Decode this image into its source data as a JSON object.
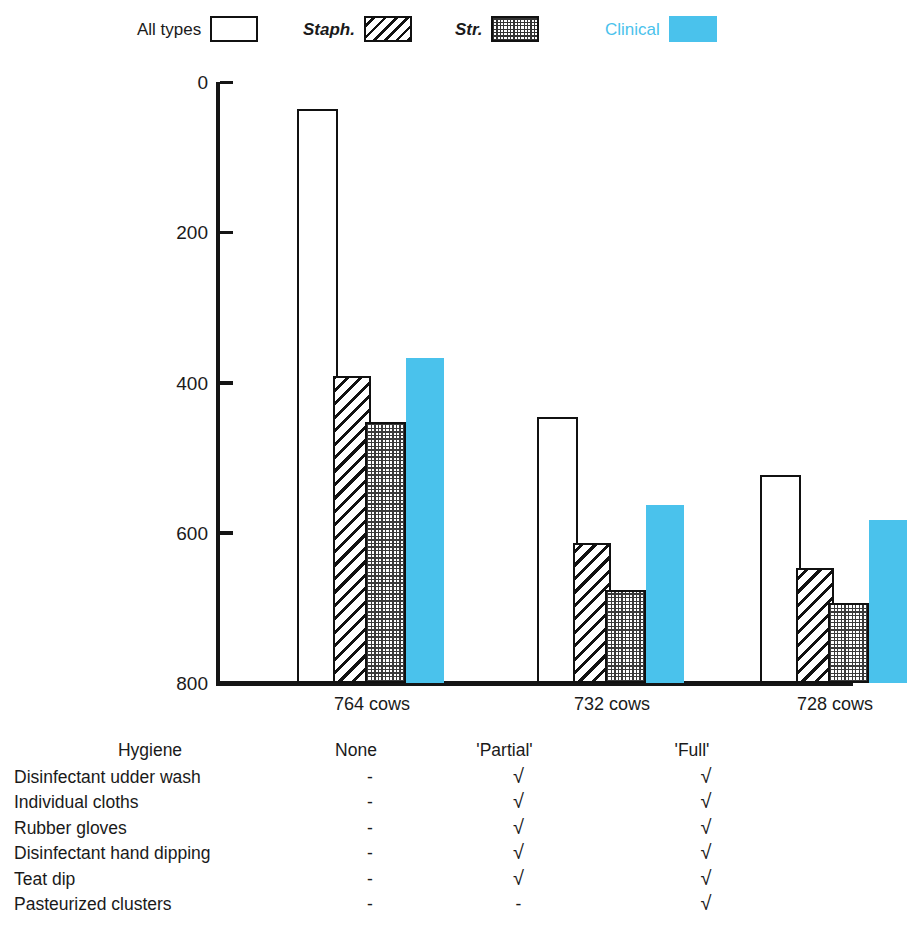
{
  "legend": {
    "items": [
      {
        "label": "All types",
        "style": "outline",
        "icon": "legend-swatch-outline",
        "x": 137
      },
      {
        "label": "Staph.",
        "style": "diagonal",
        "icon": "legend-swatch-hatched",
        "x": 303
      },
      {
        "label": "Str.",
        "style": "dotted",
        "icon": "legend-swatch-stippled",
        "x": 455
      },
      {
        "label": "Clinical",
        "style": "solid",
        "icon": "legend-swatch-solid",
        "x": 605
      }
    ]
  },
  "axis": {
    "y_ticks": [
      "800",
      "600",
      "400",
      "200",
      "0"
    ],
    "y_tick_values": [
      800,
      600,
      400,
      200,
      0
    ]
  },
  "x_labels": [
    "764 cows",
    "732 cows",
    "728 cows"
  ],
  "colors": {
    "clinical": "#4ac2ec",
    "clinical_text": "#4ac2ec",
    "axis": "#151515",
    "text": "#1a1a1a"
  },
  "table": {
    "header": {
      "name": "Hygiene",
      "values": [
        "None",
        "'Partial'",
        "'Full'"
      ]
    },
    "rows": [
      {
        "name": "Disinfectant udder wash",
        "values": [
          "-",
          "√",
          "√"
        ]
      },
      {
        "name": "Individual cloths",
        "values": [
          "-",
          "√",
          "√"
        ]
      },
      {
        "name": "Rubber gloves",
        "values": [
          "-",
          "√",
          "√"
        ]
      },
      {
        "name": "Disinfectant hand dipping",
        "values": [
          "-",
          "√",
          "√"
        ]
      },
      {
        "name": "Teat dip",
        "values": [
          "-",
          "√",
          "√"
        ]
      },
      {
        "name": "Pasteurized clusters",
        "values": [
          "-",
          "-",
          "√"
        ]
      }
    ]
  },
  "chart_data": {
    "type": "bar",
    "title": "",
    "xlabel": "",
    "ylabel": "",
    "ylim": [
      0,
      800
    ],
    "yticks": [
      0,
      200,
      400,
      600,
      800
    ],
    "grid": false,
    "legend_position": "top",
    "categories": [
      "764 cows",
      "732 cows",
      "728 cows"
    ],
    "series": [
      {
        "name": "All types",
        "values": [
          764,
          354,
          277
        ]
      },
      {
        "name": "Staph.",
        "values": [
          409,
          186,
          153
        ]
      },
      {
        "name": "Str.",
        "values": [
          347,
          124,
          106
        ]
      },
      {
        "name": "Clinical",
        "values": [
          433,
          237,
          217
        ]
      }
    ]
  }
}
